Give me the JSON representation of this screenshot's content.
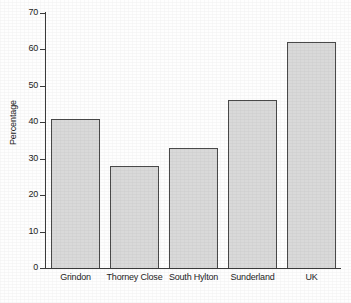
{
  "chart_data": {
    "type": "bar",
    "title": "",
    "subtitle": "",
    "xlabel": "",
    "ylabel": "Percentage",
    "categories": [
      "Grindon",
      "Thorney Close",
      "South Hylton",
      "Sunderland",
      "UK"
    ],
    "values": [
      41,
      28,
      33,
      46,
      62
    ],
    "ylim": [
      0,
      70
    ],
    "ytick_values": [
      0,
      10,
      20,
      30,
      40,
      50,
      60,
      70
    ],
    "ytick_labels": [
      "0",
      "10",
      "20",
      "30",
      "40",
      "50",
      "60",
      "70"
    ],
    "grid": false,
    "legend": null,
    "legend_position": "none",
    "annotations": [],
    "series": [
      {
        "name": "Percentage",
        "values": [
          41,
          28,
          33,
          46,
          62
        ]
      }
    ],
    "bar_fill_color": "#d9d9d9",
    "bar_edge_color": "#4a4a4a",
    "axis_color": "#3a3a3a",
    "background_color": "#ffffff"
  }
}
